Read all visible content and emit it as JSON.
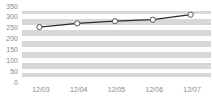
{
  "chart_data": {
    "type": "line",
    "title": "",
    "subtitle": "",
    "xlabel": "",
    "ylabel": "",
    "categories": [
      "12/03",
      "12/04",
      "12/05",
      "12/06",
      "12/07"
    ],
    "values": [
      253,
      270,
      280,
      287,
      310
    ],
    "series": [
      {
        "name": "",
        "values": [
          253,
          270,
          280,
          287,
          310
        ]
      }
    ],
    "ylim": [
      0,
      350
    ],
    "yticks": [
      0,
      50,
      100,
      150,
      200,
      250,
      300,
      350
    ],
    "ytick_labels": [
      "0",
      "50",
      "100",
      "150",
      "200",
      "250",
      "300",
      "350"
    ],
    "xtick_labels": [
      "12/03",
      "12/04",
      "12/05",
      "12/06",
      "12/07"
    ],
    "grid": true,
    "grid_orientation": "horizontal",
    "legend": false,
    "legend_position": "none",
    "annotations": [],
    "colors": {
      "plot_background": "#d8d8d8",
      "gridline": "#ffffff",
      "line": "#2b2b2b",
      "marker_fill": "#ffffff",
      "marker_edge": "#555555",
      "tick_label": "#8a8a8a",
      "page_background": "#ffffff"
    },
    "line_style": "solid",
    "marker_style": "circle"
  }
}
